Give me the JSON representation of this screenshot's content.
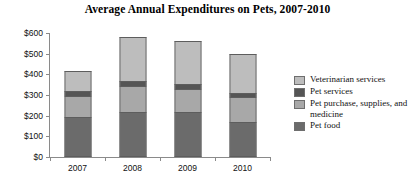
{
  "chart_data": {
    "type": "bar",
    "stacked": true,
    "title": "Average Annual Expenditures on Pets, 2007-2010",
    "xlabel": "",
    "ylabel": "",
    "categories": [
      "2007",
      "2008",
      "2009",
      "2010"
    ],
    "ylim": [
      0,
      600
    ],
    "yticks": [
      0,
      100,
      200,
      300,
      400,
      500,
      600
    ],
    "ytick_labels": [
      "$0",
      "$100",
      "$200",
      "$300",
      "$400",
      "$500",
      "$600"
    ],
    "grid": false,
    "legend_position": "right",
    "series": [
      {
        "name": "Pet food",
        "color": "#6b6b6b",
        "values": [
          193,
          219,
          219,
          170
        ]
      },
      {
        "name": "Pet purchase, supplies, and medicine",
        "color": "#a8a8a8",
        "values": [
          104,
          125,
          111,
          120
        ]
      },
      {
        "name": "Pet services",
        "color": "#555555",
        "values": [
          24,
          24,
          24,
          20
        ]
      },
      {
        "name": "Veterinarian services",
        "color": "#bdbdbd",
        "values": [
          94,
          212,
          206,
          190
        ]
      }
    ],
    "legend_order": [
      "Veterinarian services",
      "Pet services",
      "Pet purchase, supplies, and medicine",
      "Pet food"
    ],
    "totals": [
      415,
      580,
      560,
      500
    ]
  },
  "legend": {
    "items": [
      {
        "label": "Veterinarian services",
        "color": "#bdbdbd"
      },
      {
        "label": "Pet services",
        "color": "#555555"
      },
      {
        "label": "Pet purchase, supplies, and medicine",
        "color": "#a8a8a8"
      },
      {
        "label": "Pet food",
        "color": "#6b6b6b"
      }
    ]
  }
}
